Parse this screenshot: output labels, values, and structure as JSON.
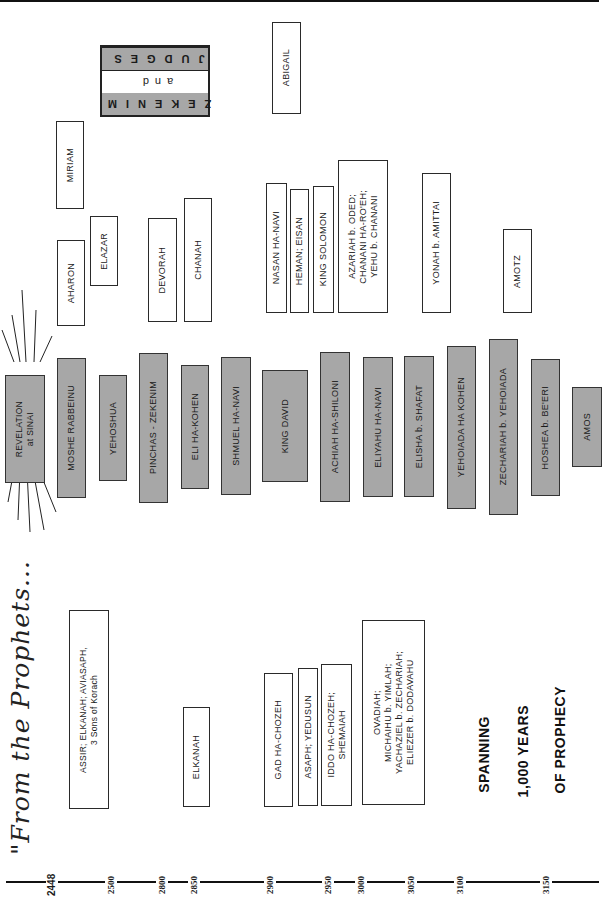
{
  "title": "\"From the Prophets...",
  "slogan": [
    "SPANNING",
    "1,000 YEARS",
    "OF PROPHECY"
  ],
  "legend_box": {
    "rows": [
      "JUDGES",
      "and",
      "ZEKENIM"
    ],
    "row_fill": [
      "#a7a7a7",
      "#ffffff",
      "#a7a7a7"
    ]
  },
  "colors": {
    "filled": "#a7a7a7",
    "outline": "#2a2a2a",
    "background": "#ffffff"
  },
  "timeline": {
    "ticks": [
      "2448",
      "2500",
      "2800",
      "2850",
      "2900",
      "2950",
      "3000",
      "3050",
      "3100",
      "3150"
    ]
  },
  "boxes": {
    "revelation": "REVELATION\nat SINAI",
    "main_line": [
      "MOSHE RABBEINU",
      "YEHOSHUA",
      "PINCHAS - ZEKENIM",
      "ELI HA-KOHEN",
      "SHMUEL HA-NAVI",
      "KING DAVID",
      "ACHIAH HA-SHILONI",
      "ELIYAHU HA-NAVI",
      "ELISHA b. SHAFAT",
      "YEHOIADA HA KOHEN",
      "ZECHARIAH b. YEHOIADA",
      "HOSHEA b. BE'ERI",
      "AMOS"
    ],
    "upper": [
      "MIRIAM",
      "AHARON",
      "ELAZAR",
      "DEVORAH",
      "CHANAH",
      "ABIGAIL",
      "NASAN HA-NAVI",
      "HEMAN; EISAN",
      "KING SOLOMON",
      "AZARIAH b. ODED;\nCHANANI HA-RO'EH;\nYEHU b. CHANANI",
      "YONAH b. AMITTAI",
      "AMOTZ"
    ],
    "lower": [
      "ASSIR; ELKANAH; AVIASAPH,\n3 Sons of Korach",
      "ELKANAH",
      "GAD HA-CHOZEH",
      "ASAPH; YEDUSUN",
      "IDDO HA-CHOZEH;\nSHEMAIAH",
      "OVADIAH;\nMICHAIHU b. YIMLAH;\nYACHAZIEL b. ZECHARIAH;\nELIEZER b. DODAVAHU"
    ]
  }
}
